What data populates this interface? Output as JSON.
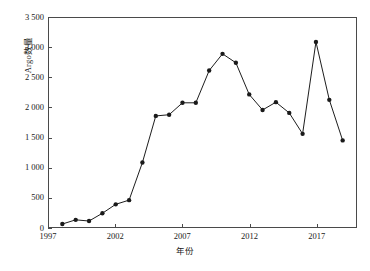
{
  "chart_data": {
    "type": "line",
    "title": "",
    "xlabel": "年份",
    "ylabel": "Argo数量",
    "xlim": [
      1997,
      2020
    ],
    "ylim": [
      0,
      3500
    ],
    "grid": false,
    "legend": null,
    "marker": "filled-circle",
    "line_color": "#1a1a1a",
    "xticks": [
      1997,
      2002,
      2007,
      2012,
      2017
    ],
    "xtick_labels": [
      "1997",
      "2002",
      "2007",
      "2012",
      "2017"
    ],
    "yticks": [
      0,
      500,
      1000,
      1500,
      2000,
      2500,
      3000,
      3500
    ],
    "ytick_labels": [
      "0",
      "500",
      "1 000",
      "1 500",
      "2 000",
      "2 500",
      "3 000",
      "3 500"
    ],
    "x": [
      1998,
      1999,
      2000,
      2001,
      2002,
      2003,
      2004,
      2005,
      2006,
      2007,
      2008,
      2009,
      2010,
      2011,
      2012,
      2013,
      2014,
      2015,
      2016,
      2017,
      2018,
      2019
    ],
    "values": [
      50,
      120,
      100,
      230,
      380,
      450,
      1080,
      1860,
      1880,
      2080,
      2080,
      2620,
      2900,
      2750,
      2220,
      1960,
      2090,
      1910,
      1560,
      3100,
      2130,
      1450
    ],
    "series": [
      {
        "name": "Argo数量",
        "values": [
          50,
          120,
          100,
          230,
          380,
          450,
          1080,
          1860,
          1880,
          2080,
          2080,
          2620,
          2900,
          2750,
          2220,
          1960,
          2090,
          1910,
          1560,
          3100,
          2130,
          1450
        ]
      }
    ]
  }
}
